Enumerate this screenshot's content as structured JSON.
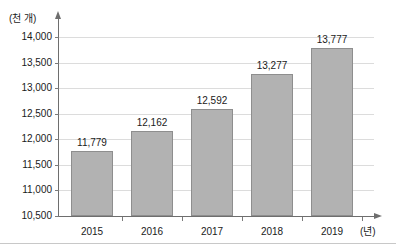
{
  "figure": {
    "title_fragment": "",
    "background": "#ffffff",
    "bottom_rule_color": "#c8c8c8"
  },
  "axes": {
    "y_unit_label": "(천 개)",
    "x_unit_label": "(년)"
  },
  "chart_data": {
    "type": "bar",
    "title": "",
    "xlabel": "(년)",
    "ylabel": "(천 개)",
    "categories": [
      "2015",
      "2016",
      "2017",
      "2018",
      "2019"
    ],
    "values": [
      11779,
      12162,
      12592,
      13277,
      13777
    ],
    "value_labels": [
      "11,779",
      "12,162",
      "12,592",
      "13,277",
      "13,777"
    ],
    "ylim": [
      10500,
      14000
    ],
    "ytick_values": [
      14000,
      13500,
      13000,
      12500,
      12000,
      11500,
      11000,
      10500
    ],
    "ytick_labels": [
      "14,000",
      "13,500",
      "13,000",
      "12,500",
      "12,000",
      "11,500",
      "11,000",
      "10,500"
    ],
    "grid": true,
    "legend": "none",
    "series_color": "#b2b2b2",
    "series_border_color": "#8e8e8e",
    "gridline_color": "#dcdcdc",
    "axis_color": "#6e6e6e"
  }
}
